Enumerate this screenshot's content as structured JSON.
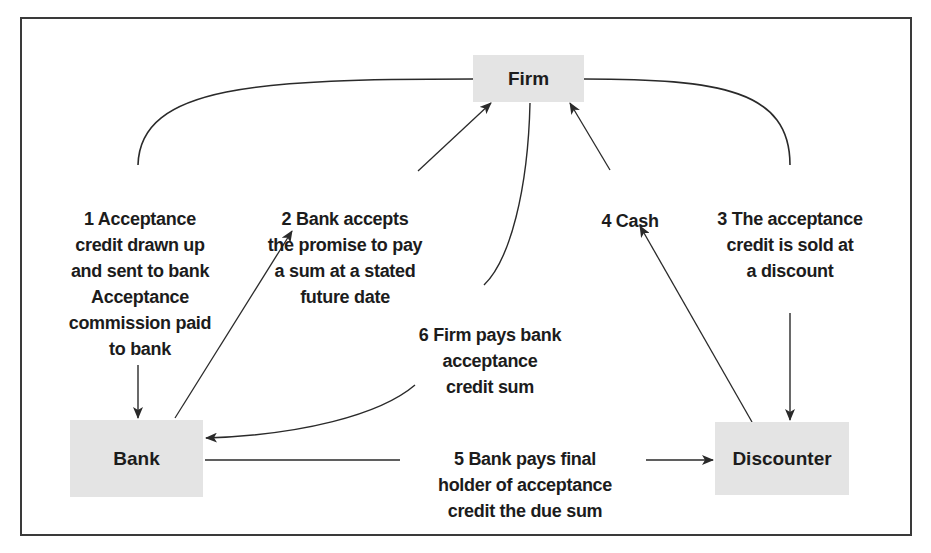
{
  "diagram": {
    "title": "",
    "nodes": {
      "firm": "Firm",
      "bank": "Bank",
      "discounter": "Discounter"
    },
    "steps": [
      {
        "num": "1",
        "text": "Acceptance\ncredit drawn up\nand sent to bank\nAcceptance\ncommission paid\nto bank",
        "from": "Firm",
        "to": "Bank"
      },
      {
        "num": "2",
        "text": "Bank accepts\nthe promise to pay\na sum at a stated\nfuture date",
        "from": "Bank",
        "to": "Firm"
      },
      {
        "num": "3",
        "text": "The acceptance\ncredit is sold at\na discount",
        "from": "Firm",
        "to": "Discounter"
      },
      {
        "num": "4",
        "text": "Cash",
        "from": "Discounter",
        "to": "Firm"
      },
      {
        "num": "5",
        "text": "Bank pays final\nholder of acceptance\ncredit the due sum",
        "from": "Bank",
        "to": "Discounter"
      },
      {
        "num": "6",
        "text": "Firm pays bank\nacceptance\ncredit sum",
        "from": "Firm",
        "to": "Bank"
      }
    ],
    "colors": {
      "node_fill": "#e4e4e4",
      "line": "#2a2a2a",
      "text": "#1c1c1c"
    }
  }
}
